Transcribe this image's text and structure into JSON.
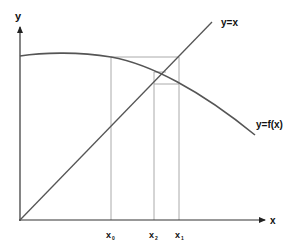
{
  "diagram": {
    "axes": {
      "x_label": "x",
      "y_label": "y"
    },
    "curves": {
      "identity_label": "y=x",
      "function_label": "y=f(x)"
    },
    "ticks": [
      {
        "main": "x",
        "sub": "0"
      },
      {
        "main": "x",
        "sub": "2"
      },
      {
        "main": "x",
        "sub": "1"
      }
    ],
    "colors": {
      "axis": "#333333",
      "curve": "#555555",
      "guide": "#aaaaaa",
      "background": "#ffffff"
    }
  }
}
